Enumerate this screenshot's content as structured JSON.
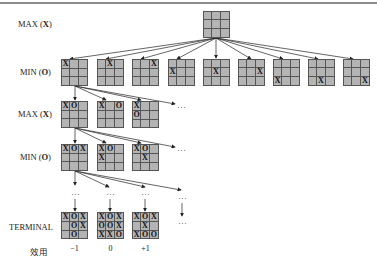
{
  "levels": {
    "max1": {
      "prefix": "MAX (",
      "sym": "X",
      "suffix": ")"
    },
    "min1": {
      "prefix": "MIN (",
      "sym": "O",
      "suffix": ")"
    },
    "max2": {
      "prefix": "MAX (",
      "sym": "X",
      "suffix": ")"
    },
    "min2": {
      "prefix": "MIN (",
      "sym": "O",
      "suffix": ")"
    },
    "terminal": "TERMINAL",
    "utility": "效用"
  },
  "root": [
    "",
    "",
    "",
    "",
    "",
    "",
    "",
    "",
    ""
  ],
  "row1": [
    [
      "X",
      "",
      "",
      "",
      "",
      "",
      "",
      "",
      ""
    ],
    [
      "",
      "X",
      "",
      "",
      "",
      "",
      "",
      "",
      ""
    ],
    [
      "",
      "",
      "X",
      "",
      "",
      "",
      "",
      "",
      ""
    ],
    [
      "",
      "",
      "",
      "X",
      "",
      "",
      "",
      "",
      ""
    ],
    [
      "",
      "",
      "",
      "",
      "X",
      "",
      "",
      "",
      ""
    ],
    [
      "",
      "",
      "",
      "",
      "",
      "X",
      "",
      "",
      ""
    ],
    [
      "",
      "",
      "",
      "",
      "",
      "",
      "X",
      "",
      ""
    ],
    [
      "",
      "",
      "",
      "",
      "",
      "",
      "",
      "X",
      ""
    ],
    [
      "",
      "",
      "",
      "",
      "",
      "",
      "",
      "",
      "X"
    ]
  ],
  "row2": [
    [
      "X",
      "O",
      "",
      "",
      "",
      "",
      "",
      "",
      ""
    ],
    [
      "X",
      "",
      "O",
      "",
      "",
      "",
      "",
      "",
      ""
    ],
    [
      "X",
      "",
      "",
      "O",
      "",
      "",
      "",
      "",
      ""
    ]
  ],
  "row3": [
    [
      "X",
      "O",
      "X",
      "",
      "",
      "",
      "",
      "",
      ""
    ],
    [
      "X",
      "O",
      "",
      "X",
      "",
      "",
      "",
      "",
      ""
    ],
    [
      "X",
      "O",
      "",
      "",
      "X",
      "",
      "",
      "",
      ""
    ]
  ],
  "terminals": [
    {
      "cells": [
        "X",
        "O",
        "X",
        "",
        "O",
        "X",
        "",
        "O",
        ""
      ],
      "utility": "−1"
    },
    {
      "cells": [
        "X",
        "O",
        "X",
        "O",
        "O",
        "X",
        "X",
        "X",
        "O"
      ],
      "utility": "0"
    },
    {
      "cells": [
        "X",
        "O",
        "X",
        "",
        "X",
        "",
        "X",
        "O",
        "O"
      ],
      "utility": "+1"
    }
  ],
  "ellipsis": "···"
}
